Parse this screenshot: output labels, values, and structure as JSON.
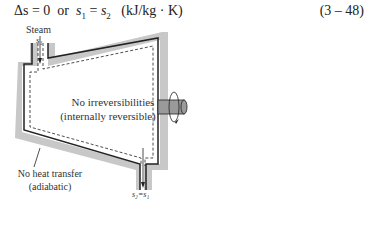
{
  "equation": {
    "lhs": "Δs = 0",
    "or": "or",
    "s1": "s",
    "s1_sub": "1",
    "eq": "=",
    "s2": "s",
    "s2_sub": "2",
    "units": "(kJ/kg · K)",
    "number": "(3 – 48)"
  },
  "figure": {
    "inlet_label": "Steam",
    "inlet_state": "s₁",
    "internal_label_line1": "No irreversibilities",
    "internal_label_line2": "(internally reversible)",
    "wall_label_line1": "No heat transfer",
    "wall_label_line2": "(adiabatic)",
    "outlet_state": "s₂=s₁",
    "colors": {
      "wall": "#c8c8c8",
      "line": "#222222",
      "shaft": "#9a9a9a"
    }
  }
}
